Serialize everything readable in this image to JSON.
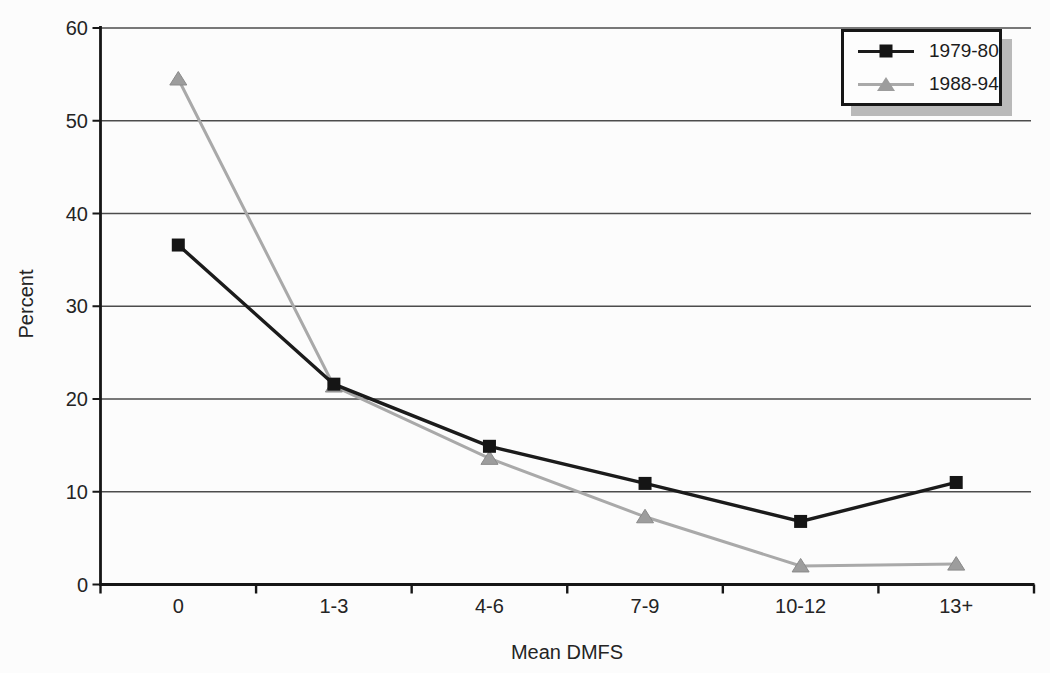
{
  "chart_data": {
    "type": "line",
    "categories": [
      "0",
      "1-3",
      "4-6",
      "7-9",
      "10-12",
      "13+"
    ],
    "series": [
      {
        "name": "1979-80",
        "values": [
          36.6,
          21.6,
          14.9,
          10.9,
          6.8,
          11.0
        ],
        "color": "#1b1b1b",
        "marker": "square",
        "marker_color": "#151515",
        "line_width": 3.4
      },
      {
        "name": "1988-94",
        "values": [
          54.5,
          21.4,
          13.6,
          7.3,
          2.0,
          2.2
        ],
        "color": "#a9a9a9",
        "marker": "triangle",
        "marker_color": "#9d9d9d",
        "marker_edge": "#8a8a8a",
        "line_width": 3.0
      }
    ],
    "title": "",
    "xlabel": "Mean DMFS",
    "ylabel": "Percent",
    "ylim": [
      0,
      60
    ],
    "yticks": [
      0,
      10,
      20,
      30,
      40,
      50,
      60
    ],
    "grid": "horizontal",
    "legend_position": "top-right"
  },
  "colors": {
    "background": "#fcfcfc",
    "axis": "#161616",
    "gridline": "#4c4c4c",
    "tick_text": "#242424",
    "legend_border": "#161616",
    "legend_shadow": "#b9b9b9"
  }
}
